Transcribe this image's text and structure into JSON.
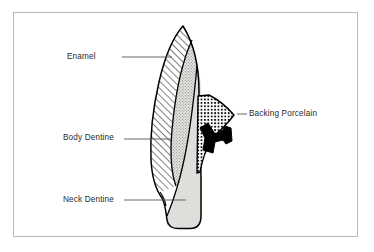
{
  "figure": {
    "background_color": "#ffffff",
    "frame_color": "#b9b9b9",
    "outline_color": "#000000",
    "text_color": "#2b2b2b"
  },
  "labels": [
    {
      "id": "enamel",
      "text": "Enamel",
      "leader": {
        "x1": 122,
        "y1": 57,
        "x2": 172,
        "y2": 57
      },
      "target_region": "enamel-layer"
    },
    {
      "id": "body_dentine",
      "text": "Body Dentine",
      "leader": {
        "x1": 124,
        "y1": 139,
        "x2": 171,
        "y2": 139
      },
      "target_region": "body-dentine-layer"
    },
    {
      "id": "neck_dentine",
      "text": "Neck Dentine",
      "leader": {
        "x1": 124,
        "y1": 200,
        "x2": 186,
        "y2": 200
      },
      "target_region": "neck-dentine-layer"
    },
    {
      "id": "backing_porcelain",
      "text": "Backing Porcelain",
      "leader": {
        "x1": 237,
        "y1": 114,
        "x2": 247,
        "y2": 114
      },
      "target_region": "backing-porcelain-layer"
    }
  ],
  "regions": [
    {
      "id": "enamel-layer",
      "name": "Enamel",
      "fill": "diagonal-hatch",
      "fill_color": "#ffffff",
      "hatch_color": "#1a1a1a"
    },
    {
      "id": "body-dentine-layer",
      "name": "Body Dentine",
      "fill": "stipple",
      "fill_color": "#e8e6e2",
      "stipple_color": "#8d8d8d"
    },
    {
      "id": "neck-dentine-layer",
      "name": "Neck Dentine",
      "fill": "solid",
      "fill_color": "#e0dedb"
    },
    {
      "id": "backing-porcelain-layer",
      "name": "Backing Porcelain",
      "fill": "cross-hatch",
      "fill_color": "#ffffff",
      "hatch_color": "#111111"
    },
    {
      "id": "metal-post",
      "name": "Metal post and clasp",
      "fill": "solid",
      "fill_color": "#000000"
    }
  ]
}
